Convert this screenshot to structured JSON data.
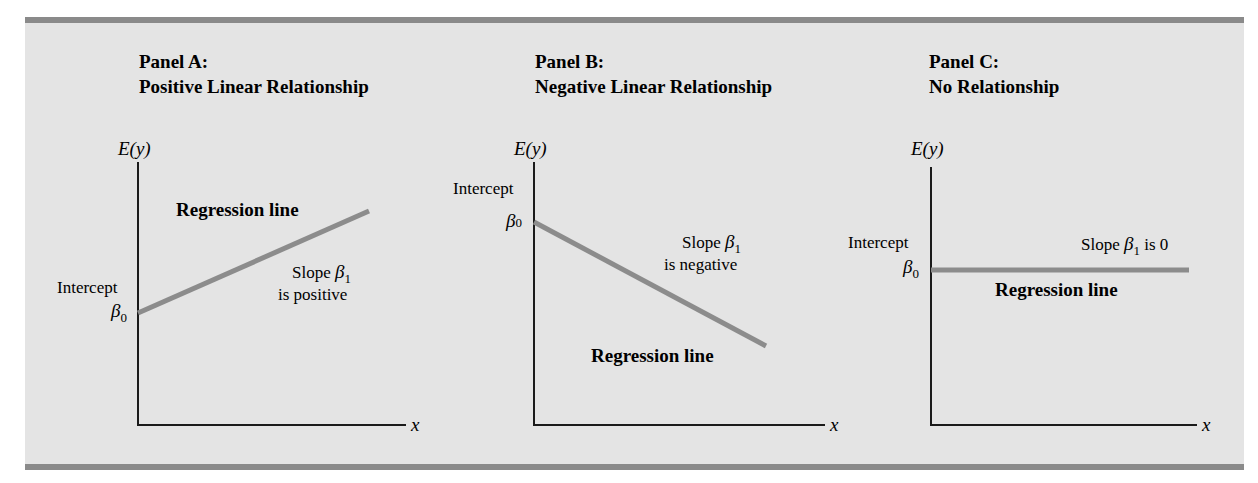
{
  "figure": {
    "header_text_cropped": "MODEL IN SIMPLE LINEAR REGRESSION",
    "colors": {
      "panel_background": "#e4e4e4",
      "border_bar": "#8a8a8a",
      "regression_line": "#8c8c8c",
      "axis": "#1a1a1a"
    },
    "panels": [
      {
        "id": "A",
        "label": "Panel A:",
        "title": "Positive Linear Relationship",
        "y_axis_label": "E(y)",
        "x_axis_label": "x",
        "intercept_label": "Intercept",
        "beta0": "β",
        "beta0_sub": "0",
        "slope_prefix": "Slope",
        "beta1": "β",
        "beta1_sub": "1",
        "slope_desc": "is positive",
        "regression_label": "Regression line"
      },
      {
        "id": "B",
        "label": "Panel B:",
        "title": "Negative Linear Relationship",
        "y_axis_label": "E(y)",
        "x_axis_label": "x",
        "intercept_label": "Intercept",
        "beta0": "β",
        "beta0_sub": "0",
        "slope_prefix": "Slope",
        "beta1": "β",
        "beta1_sub": "1",
        "slope_desc": "is negative",
        "regression_label": "Regression line"
      },
      {
        "id": "C",
        "label": "Panel C:",
        "title": "No Relationship",
        "y_axis_label": "E(y)",
        "x_axis_label": "x",
        "intercept_label": "Intercept",
        "beta0": "β",
        "beta0_sub": "0",
        "slope_prefix": "Slope",
        "beta1": "β",
        "beta1_sub": "1",
        "slope_desc": "is 0",
        "regression_label": "Regression line"
      }
    ]
  }
}
